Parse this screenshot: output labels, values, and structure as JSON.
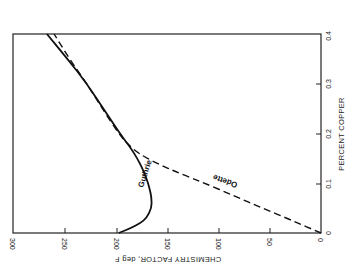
{
  "chart_data": {
    "type": "line",
    "orientation": "rotated-90-clockwise",
    "title": "",
    "xlabel": "PERCENT COPPER",
    "ylabel": "CHEMISTRY FACTOR, deg F",
    "xlim": [
      0,
      0.4
    ],
    "ylim": [
      0,
      300
    ],
    "x_ticks": [
      0,
      0.1,
      0.2,
      0.3,
      0.4
    ],
    "x_tick_labels": [
      "0",
      "0.1",
      "0.2",
      "0.3",
      "0.4"
    ],
    "y_ticks": [
      0,
      50,
      100,
      150,
      200,
      250,
      300
    ],
    "y_tick_labels": [
      "0",
      "50",
      "100",
      "150",
      "200",
      "250",
      "300"
    ],
    "grid": false,
    "legend": "inline labels",
    "series": [
      {
        "name": "Guthrie",
        "style": "solid",
        "x": [
          0,
          0.01,
          0.02,
          0.03,
          0.05,
          0.07,
          0.09,
          0.11,
          0.13,
          0.15,
          0.17,
          0.2,
          0.25,
          0.3,
          0.35,
          0.4
        ],
        "y": [
          197,
          185,
          176,
          170,
          165,
          165,
          167,
          170,
          174,
          179,
          185,
          196,
          212,
          228,
          247,
          267
        ]
      },
      {
        "name": "Odette",
        "style": "dashed",
        "x": [
          0,
          0.025,
          0.05,
          0.075,
          0.1,
          0.12,
          0.14,
          0.16,
          0.18,
          0.2,
          0.25,
          0.3,
          0.35,
          0.4
        ],
        "y": [
          0,
          28,
          57,
          85,
          113,
          138,
          160,
          178,
          189,
          197,
          213,
          228,
          245,
          260
        ]
      }
    ],
    "annotations": [
      "Guthrie",
      "Odette"
    ]
  },
  "labels": {
    "x_axis_title": "PERCENT COPPER",
    "y_axis_title": "CHEMISTRY FACTOR, deg F",
    "guthrie": "Guthrie",
    "odette": "Odette",
    "x_ticks": [
      "0",
      "0.1",
      "0.2",
      "0.3",
      "0.4"
    ],
    "y_ticks": [
      "300",
      "250",
      "200",
      "150",
      "100",
      "50",
      "0"
    ]
  }
}
